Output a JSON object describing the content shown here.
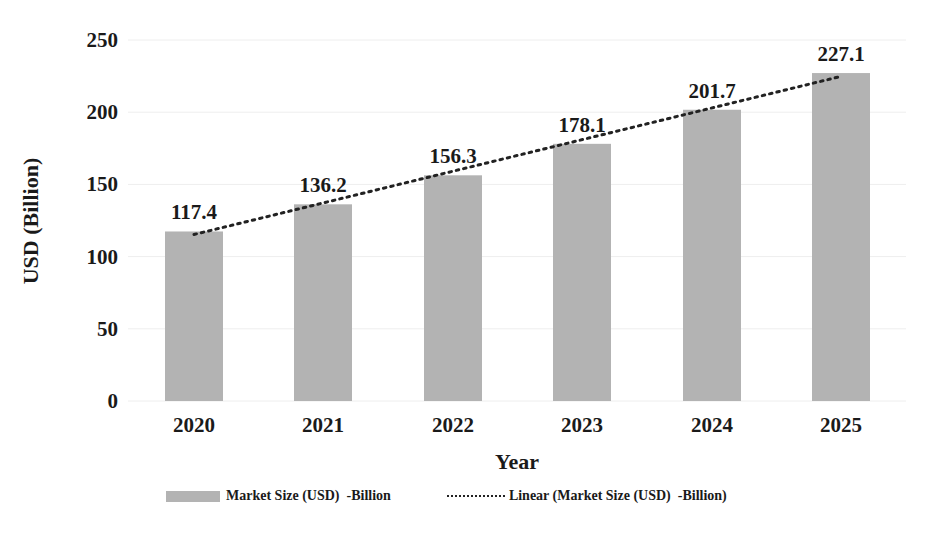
{
  "chart_data": {
    "type": "bar",
    "title": "",
    "xlabel": "Year",
    "ylabel": "USD (Billion)",
    "categories": [
      "2020",
      "2021",
      "2022",
      "2023",
      "2024",
      "2025"
    ],
    "series": [
      {
        "name": "Market Size (USD)  -Billion",
        "type": "bar",
        "values": [
          117.4,
          136.2,
          156.3,
          178.1,
          201.7,
          227.1
        ],
        "color": "#b3b3b3"
      },
      {
        "name": "Linear (Market Size (USD)  -Billion)",
        "type": "line",
        "style": "dotted",
        "values": [
          115.3,
          137.2,
          159.1,
          181.0,
          202.9,
          224.8
        ],
        "color": "#222222"
      }
    ],
    "data_labels": [
      "117.4",
      "136.2",
      "156.3",
      "178.1",
      "201.7",
      "227.1"
    ],
    "yticks": [
      0,
      50,
      100,
      150,
      200,
      250
    ],
    "ylim": [
      0,
      250
    ],
    "grid": true,
    "legend_position": "bottom"
  },
  "axes": {
    "y_title": "USD (Billion)",
    "x_title": "Year",
    "y_tick_labels": [
      "0",
      "50",
      "100",
      "150",
      "200",
      "250"
    ]
  },
  "legend": {
    "bar_label": "Market Size (USD)  -Billion",
    "line_label": "Linear (Market Size (USD)  -Billion)"
  },
  "colors": {
    "bar": "#b3b3b3",
    "trendline": "#222222",
    "grid": "#eeeeee",
    "text": "#1a1a1a"
  }
}
